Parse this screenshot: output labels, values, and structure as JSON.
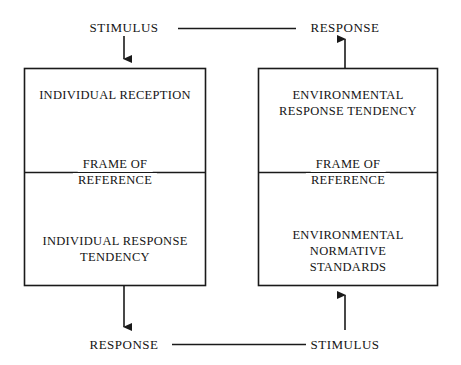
{
  "diagram": {
    "top_row": {
      "left_label": "STIMULUS",
      "right_label": "RESPONSE",
      "connector": "horizontal-line"
    },
    "bottom_row": {
      "left_label": "RESPONSE",
      "right_label": "STIMULUS",
      "connector": "horizontal-line"
    },
    "boxes": [
      {
        "id": "individual",
        "upper_text": "INDIVIDUAL RECEPTION",
        "divider_text_top": "FRAME OF",
        "divider_text_bottom": "REFERENCE",
        "lower_text_line1": "INDIVIDUAL RESPONSE",
        "lower_text_line2": "TENDENCY"
      },
      {
        "id": "environmental",
        "upper_text_line1": "ENVIRONMENTAL",
        "upper_text_line2": "RESPONSE TENDENCY",
        "divider_text_top": "FRAME OF",
        "divider_text_bottom": "REFERENCE",
        "lower_text_line1": "ENVIRONMENTAL",
        "lower_text_line2": "NORMATIVE",
        "lower_text_line3": "STANDARDS"
      }
    ],
    "arrows": [
      {
        "id": "top-left-down",
        "direction": "down",
        "from": "STIMULUS",
        "to": "individual-box"
      },
      {
        "id": "top-right-up",
        "direction": "up",
        "from": "environmental-box",
        "to": "RESPONSE"
      },
      {
        "id": "bottom-left-down",
        "direction": "down",
        "from": "individual-box",
        "to": "RESPONSE"
      },
      {
        "id": "bottom-right-up",
        "direction": "up",
        "from": "STIMULUS",
        "to": "environmental-box"
      }
    ],
    "colors": {
      "stroke": "#1a1a1a",
      "background": "#ffffff",
      "text": "#141414"
    }
  }
}
